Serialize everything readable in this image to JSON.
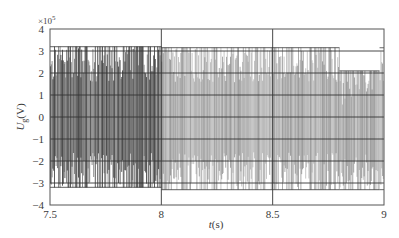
{
  "chart_data": {
    "type": "line",
    "title": "",
    "xlabel": "t(s)",
    "xlabel_var": "t",
    "xlabel_unit": "(s)",
    "ylabel": "U_g(V)",
    "ylabel_var": "U",
    "ylabel_sub": "g",
    "ylabel_unit": "(V)",
    "y_scale_label": "×10^5",
    "y_scale_base": "×10",
    "y_scale_exp": "5",
    "xlim": [
      7.5,
      9.0
    ],
    "ylim": [
      -4,
      4
    ],
    "x_ticks": [
      7.5,
      8,
      8.5,
      9
    ],
    "x_tick_labels": [
      "7.5",
      "8",
      "8.5",
      "9"
    ],
    "y_ticks": [
      -4,
      -3,
      -2,
      -1,
      0,
      1,
      2,
      3,
      4
    ],
    "y_tick_labels": [
      "-4",
      "-3",
      "-2",
      "-1",
      "0",
      "1",
      "2",
      "3",
      "4"
    ],
    "grid": true,
    "legend": null,
    "series": [
      {
        "name": "U_g",
        "description": "Dense high-frequency oscillating voltage waveform (units ×10^5 V)",
        "envelope": [
          {
            "t_start": 7.5,
            "t_end": 8.0,
            "upper": 3.2,
            "lower": -3.2
          },
          {
            "t_start": 8.0,
            "t_end": 8.8,
            "upper": 3.15,
            "lower": -3.3
          },
          {
            "t_start": 8.8,
            "t_end": 8.98,
            "upper": 2.1,
            "lower": -3.3
          },
          {
            "t_start": 8.98,
            "t_end": 9.0,
            "upper": 3.15,
            "lower": -3.3
          }
        ],
        "inner_levels": [
          1.6,
          0.3,
          -1.6
        ],
        "approx_cycles": 150
      }
    ]
  },
  "colors": {
    "frame": "#555555",
    "grid": "#333333",
    "wave_dark": "#2a2a2a",
    "wave_mid": "#6a6a6a",
    "wave_light": "#9a9a9a",
    "background": "#ffffff"
  }
}
